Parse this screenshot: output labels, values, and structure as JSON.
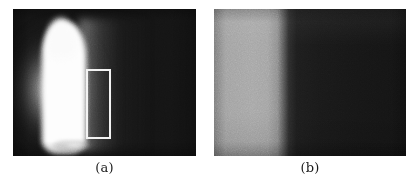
{
  "figure": {
    "kind": "two-panel grayscale imaging figure",
    "background_color": "#ffffff",
    "panels": [
      {
        "id": "a",
        "caption": "(a)",
        "description": "grayscale image with a tall saturated white vertical flame-like column on the left over a dark background, with a white rectangular region-of-interest box drawn to the right of the column",
        "frame": {
          "x": 13,
          "y": 9,
          "width": 183,
          "height": 147
        },
        "background_color": "#141414",
        "feature_color": "#fdfdfd",
        "overlay": {
          "name": "region-of-interest-box",
          "stroke_color": "#f2f2f2",
          "stroke_width": 2,
          "x": 73,
          "y": 60,
          "width": 25,
          "height": 70
        }
      },
      {
        "id": "b",
        "caption": "(b)",
        "description": "grayscale image showing a bright gray band along the left edge that falls off sharply to a dark uniform field on the right",
        "frame": {
          "x": 214,
          "y": 9,
          "width": 192,
          "height": 147
        },
        "bright_color": "#a6a6a6",
        "dark_color": "#171717",
        "edge_position_fraction": 0.37
      }
    ]
  },
  "captions": {
    "a": "(a)",
    "b": "(b)"
  }
}
